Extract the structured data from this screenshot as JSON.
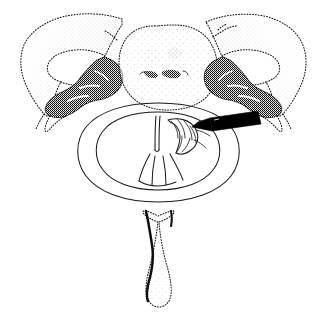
{
  "figure": {
    "panel_label": "A",
    "caption_text": "",
    "background_color": "#ffffff",
    "ink_color": "#111111",
    "needle_color": "#000000",
    "width_px": 317,
    "height_px": 313
  },
  "structures": {
    "vertebral_body": {
      "name": "vertebral-body",
      "shading": "light stipple",
      "position": "top-center"
    },
    "left_transverse_process": {
      "name": "left-transverse-process",
      "shading": "graded stipple",
      "position": "top-left"
    },
    "right_transverse_process": {
      "name": "right-transverse-process",
      "shading": "graded stipple",
      "position": "top-right"
    },
    "left_facet": {
      "name": "left-facet-joint",
      "shading": "dense stipple",
      "position": "mid-left"
    },
    "right_facet": {
      "name": "right-facet-joint",
      "shading": "dense stipple",
      "position": "mid-right"
    },
    "thecal_sac": {
      "name": "thecal-sac-dura",
      "shading": "outline only",
      "position": "center"
    },
    "spinal_cord": {
      "name": "spinal-cord",
      "shading": "outline only",
      "position": "center"
    },
    "median_fissure": {
      "name": "median-fissure",
      "shading": "line",
      "position": "center"
    },
    "dorsal_rootlets": {
      "name": "dorsal-rootlets",
      "shading": "segmented outline",
      "position": "center-right"
    },
    "spinous_process": {
      "name": "spinous-process",
      "shading": "stipple outline",
      "position": "bottom-center"
    },
    "needle": {
      "name": "needle-probe",
      "shading": "solid black",
      "position": "entering from right",
      "tip_target": "dorsal-rootlets"
    }
  }
}
